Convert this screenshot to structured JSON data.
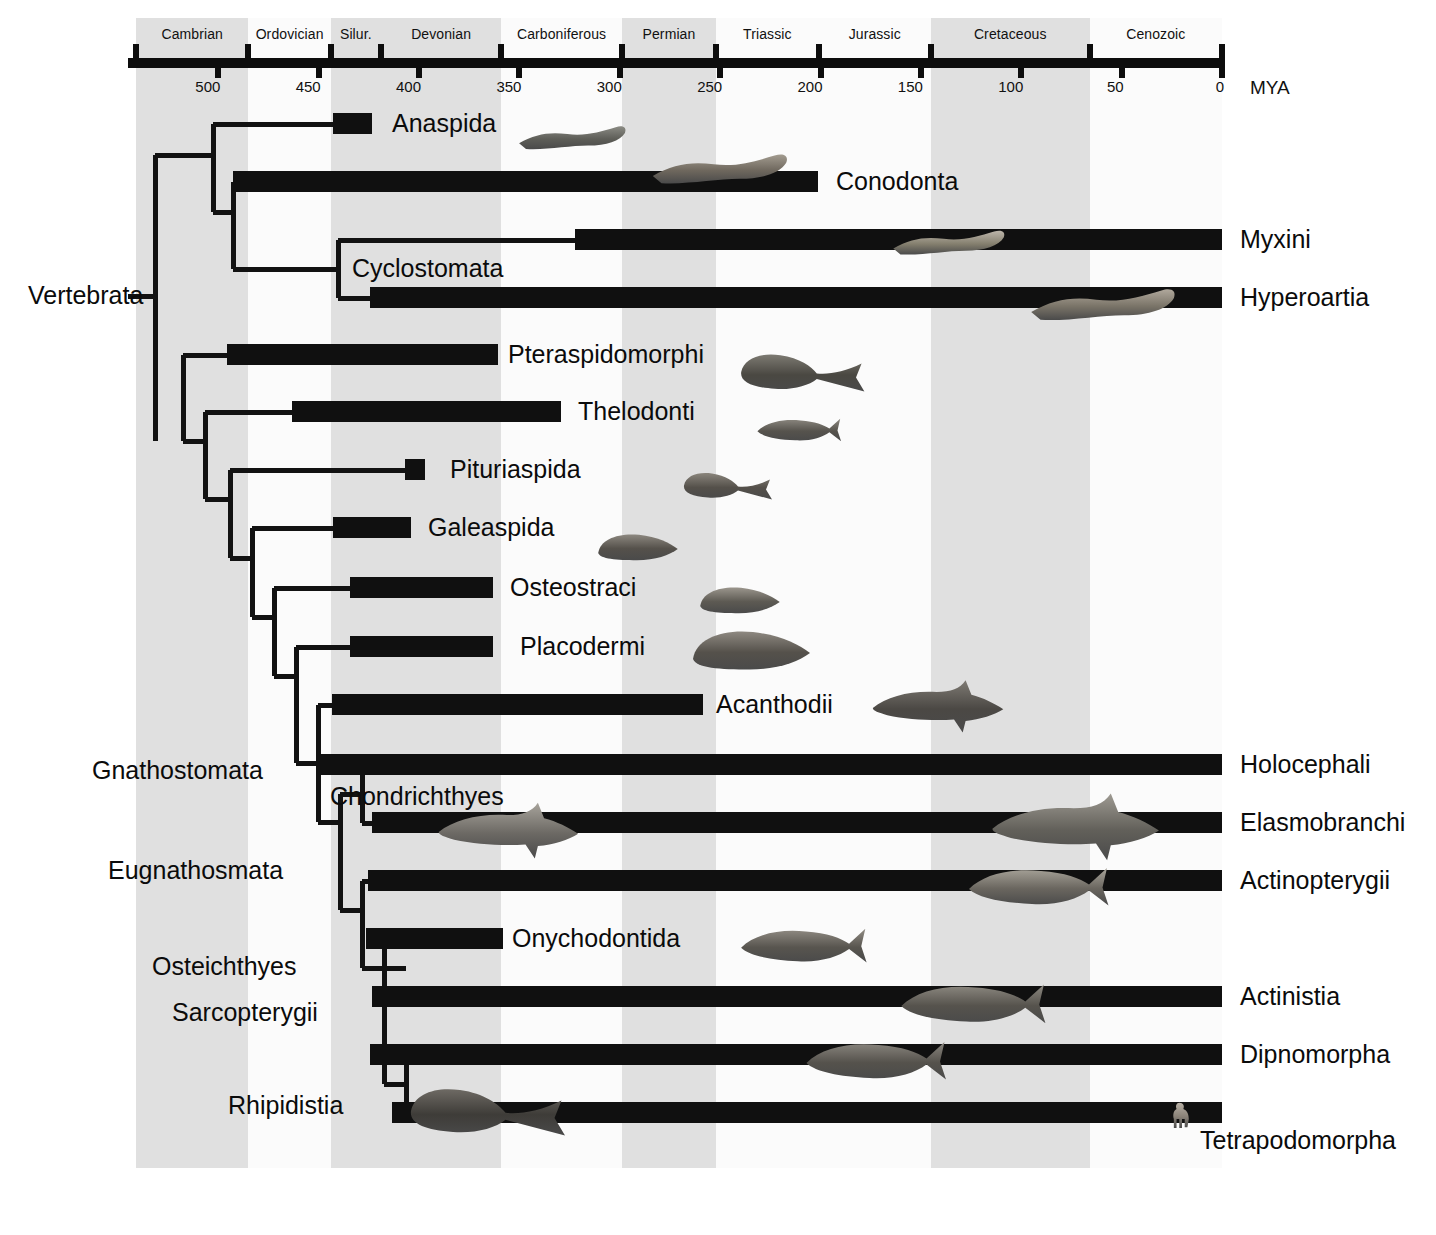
{
  "figure": {
    "kind": "phylogenetic-tree-with-geologic-timescale",
    "axis_unit_label": "MYA"
  },
  "timescale": {
    "periods": [
      {
        "name": "Cambrian",
        "start_mya": 541,
        "end_mya": 485,
        "shaded": true
      },
      {
        "name": "Ordovician",
        "start_mya": 485,
        "end_mya": 444,
        "shaded": false
      },
      {
        "name": "Silur.",
        "start_mya": 444,
        "end_mya": 419,
        "shaded": true
      },
      {
        "name": "Devonian",
        "start_mya": 419,
        "end_mya": 359,
        "shaded": true
      },
      {
        "name": "Carboniferous",
        "start_mya": 359,
        "end_mya": 299,
        "shaded": false
      },
      {
        "name": "Permian",
        "start_mya": 299,
        "end_mya": 252,
        "shaded": true
      },
      {
        "name": "Triassic",
        "start_mya": 252,
        "end_mya": 201,
        "shaded": false
      },
      {
        "name": "Jurassic",
        "start_mya": 201,
        "end_mya": 145,
        "shaded": false
      },
      {
        "name": "Cretaceous",
        "start_mya": 145,
        "end_mya": 66,
        "shaded": true
      },
      {
        "name": "Cenozoic",
        "start_mya": 66,
        "end_mya": 0,
        "shaded": false
      }
    ],
    "tick_values": [
      500,
      450,
      400,
      350,
      300,
      250,
      200,
      150,
      100,
      50,
      0
    ],
    "tick_labels": [
      "500",
      "450",
      "400",
      "350",
      "300",
      "250",
      "200",
      "150",
      "100",
      "50",
      "0"
    ],
    "axis_range_mya": [
      545,
      0
    ]
  },
  "taxa": [
    {
      "name": "Anaspida",
      "first_mya": 440,
      "last_mya": 418,
      "label_side": "right"
    },
    {
      "name": "Conodonta",
      "first_mya": 510,
      "last_mya": 200,
      "label_side": "right"
    },
    {
      "name": "Myxini",
      "first_mya": 360,
      "last_mya": 0,
      "label_side": "right"
    },
    {
      "name": "Hyperoartia",
      "first_mya": 365,
      "last_mya": 0,
      "label_side": "right"
    },
    {
      "name": "Pteraspidomorphi",
      "first_mya": 512,
      "last_mya": 360,
      "label_side": "right"
    },
    {
      "name": "Thelodonti",
      "first_mya": 480,
      "last_mya": 360,
      "label_side": "right"
    },
    {
      "name": "Pituriaspida",
      "first_mya": 400,
      "last_mya": 392,
      "label_side": "right"
    },
    {
      "name": "Galeaspida",
      "first_mya": 440,
      "last_mya": 400,
      "label_side": "right"
    },
    {
      "name": "Osteostraci",
      "first_mya": 432,
      "last_mya": 360,
      "label_side": "right"
    },
    {
      "name": "Placodermi",
      "first_mya": 432,
      "last_mya": 360,
      "label_side": "right"
    },
    {
      "name": "Acanthodii",
      "first_mya": 440,
      "last_mya": 255,
      "label_side": "right"
    },
    {
      "name": "Holocephali",
      "first_mya": 440,
      "last_mya": 0,
      "label_side": "right"
    },
    {
      "name": "Elasmobranchi",
      "first_mya": 430,
      "last_mya": 0,
      "label_side": "right"
    },
    {
      "name": "Actinopterygii",
      "first_mya": 420,
      "last_mya": 0,
      "label_side": "right"
    },
    {
      "name": "Onychodontida",
      "first_mya": 420,
      "last_mya": 370,
      "label_side": "right"
    },
    {
      "name": "Actinistia",
      "first_mya": 420,
      "last_mya": 0,
      "label_side": "right"
    },
    {
      "name": "Dipnomorpha",
      "first_mya": 420,
      "last_mya": 0,
      "label_side": "right"
    },
    {
      "name": "Tetrapodomorpha",
      "first_mya": 415,
      "last_mya": 0,
      "label_side": "right"
    }
  ],
  "clades": [
    {
      "name": "Vertebrata"
    },
    {
      "name": "Cyclostomata"
    },
    {
      "name": "Gnathostomata"
    },
    {
      "name": "Eugnathosmata"
    },
    {
      "name": "Chondrichthyes"
    },
    {
      "name": "Osteichthyes"
    },
    {
      "name": "Sarcopterygii"
    },
    {
      "name": "Rhipidistia"
    }
  ],
  "colors": {
    "band_shaded": "#e0e0e0",
    "band_plain": "#fbfbfb",
    "ink": "#101010",
    "page": "#ffffff"
  },
  "chart_data": {
    "type": "bar",
    "title": "",
    "xlabel": "MYA",
    "ylabel": "",
    "xlim": [
      545,
      0
    ],
    "grid": false,
    "legend": "none",
    "categories": [
      "Anaspida",
      "Conodonta",
      "Myxini",
      "Hyperoartia",
      "Pteraspidomorphi",
      "Thelodonti",
      "Pituriaspida",
      "Galeaspida",
      "Osteostraci",
      "Placodermi",
      "Acanthodii",
      "Holocephali",
      "Elasmobranchi",
      "Actinopterygii",
      "Onychodontida",
      "Actinistia",
      "Dipnomorpha",
      "Tetrapodomorpha"
    ],
    "series": [
      {
        "name": "first appearance (MYA)",
        "values": [
          440,
          510,
          360,
          365,
          512,
          480,
          400,
          440,
          432,
          432,
          440,
          440,
          430,
          420,
          420,
          420,
          420,
          415
        ]
      },
      {
        "name": "last appearance (MYA)",
        "values": [
          418,
          200,
          0,
          0,
          360,
          360,
          392,
          400,
          360,
          360,
          255,
          0,
          0,
          0,
          370,
          0,
          0,
          0
        ]
      }
    ],
    "tick_labels": [
      "500",
      "450",
      "400",
      "350",
      "300",
      "250",
      "200",
      "150",
      "100",
      "50",
      "0"
    ]
  }
}
